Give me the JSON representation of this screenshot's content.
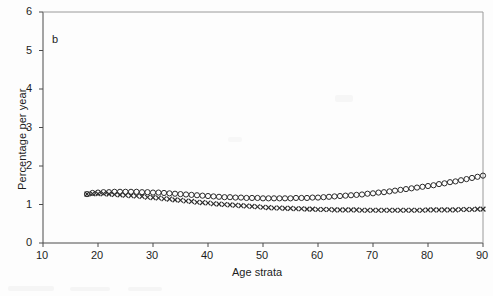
{
  "figure": {
    "panel_label": "b",
    "background_color": "#fdfdfd",
    "axis_color": "#4a4a4a"
  },
  "chart_data": {
    "type": "scatter",
    "title": "",
    "panel": "b",
    "xlabel": "Age strata",
    "ylabel": "Percentage per year",
    "xlim": [
      10,
      90
    ],
    "ylim": [
      0,
      6
    ],
    "xticks": [
      10,
      20,
      30,
      40,
      50,
      60,
      70,
      80,
      90
    ],
    "yticks": [
      0,
      1,
      2,
      3,
      4,
      5,
      6
    ],
    "grid": false,
    "legend": "none",
    "x": [
      18,
      19,
      20,
      21,
      22,
      23,
      24,
      25,
      26,
      27,
      28,
      29,
      30,
      31,
      32,
      33,
      34,
      35,
      36,
      37,
      38,
      39,
      40,
      41,
      42,
      43,
      44,
      45,
      46,
      47,
      48,
      49,
      50,
      51,
      52,
      53,
      54,
      55,
      56,
      57,
      58,
      59,
      60,
      61,
      62,
      63,
      64,
      65,
      66,
      67,
      68,
      69,
      70,
      71,
      72,
      73,
      74,
      75,
      76,
      77,
      78,
      79,
      80,
      81,
      82,
      83,
      84,
      85,
      86,
      87,
      88,
      89,
      90
    ],
    "series": [
      {
        "name": "open-circle-series",
        "marker": "circle-open",
        "color": "#2b2b2b",
        "values": [
          1.27,
          1.3,
          1.31,
          1.32,
          1.32,
          1.33,
          1.33,
          1.33,
          1.33,
          1.33,
          1.32,
          1.32,
          1.31,
          1.31,
          1.3,
          1.29,
          1.28,
          1.27,
          1.26,
          1.25,
          1.24,
          1.23,
          1.22,
          1.21,
          1.2,
          1.19,
          1.19,
          1.18,
          1.18,
          1.17,
          1.17,
          1.17,
          1.16,
          1.16,
          1.16,
          1.16,
          1.16,
          1.16,
          1.17,
          1.17,
          1.17,
          1.18,
          1.18,
          1.19,
          1.2,
          1.21,
          1.22,
          1.23,
          1.24,
          1.25,
          1.26,
          1.28,
          1.29,
          1.31,
          1.32,
          1.34,
          1.36,
          1.38,
          1.4,
          1.42,
          1.44,
          1.46,
          1.48,
          1.5,
          1.53,
          1.55,
          1.58,
          1.6,
          1.63,
          1.66,
          1.69,
          1.72,
          1.75
        ]
      },
      {
        "name": "cross-marker-series",
        "marker": "x",
        "color": "#2b2b2b",
        "values": [
          1.27,
          1.28,
          1.28,
          1.28,
          1.27,
          1.26,
          1.25,
          1.24,
          1.23,
          1.22,
          1.21,
          1.19,
          1.18,
          1.17,
          1.15,
          1.14,
          1.12,
          1.11,
          1.09,
          1.08,
          1.06,
          1.05,
          1.04,
          1.02,
          1.01,
          1.0,
          0.99,
          0.98,
          0.97,
          0.96,
          0.95,
          0.94,
          0.93,
          0.92,
          0.91,
          0.91,
          0.9,
          0.9,
          0.89,
          0.89,
          0.88,
          0.88,
          0.87,
          0.87,
          0.87,
          0.86,
          0.86,
          0.86,
          0.86,
          0.86,
          0.85,
          0.85,
          0.85,
          0.85,
          0.85,
          0.85,
          0.85,
          0.85,
          0.85,
          0.85,
          0.85,
          0.85,
          0.86,
          0.86,
          0.86,
          0.86,
          0.86,
          0.86,
          0.87,
          0.87,
          0.87,
          0.88,
          0.88
        ]
      }
    ]
  }
}
